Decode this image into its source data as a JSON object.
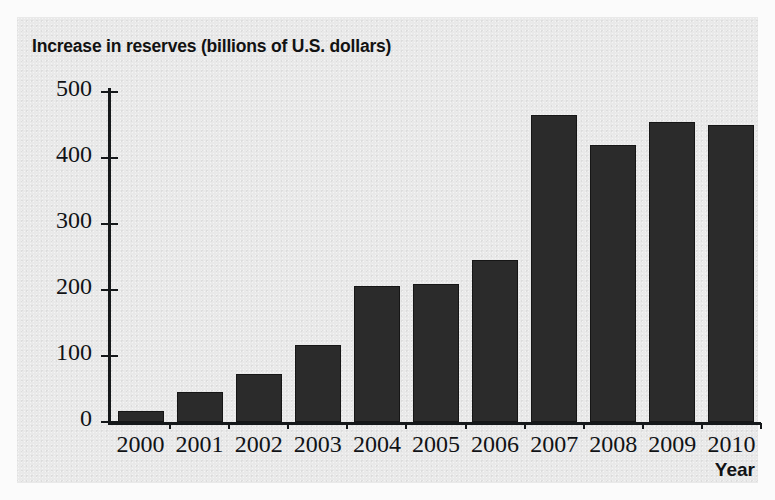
{
  "chart_data": {
    "type": "bar",
    "title": "Increase in reserves (billions of U.S. dollars)",
    "xlabel": "Year",
    "ylabel": "",
    "categories": [
      "2000",
      "2001",
      "2002",
      "2003",
      "2004",
      "2005",
      "2006",
      "2007",
      "2008",
      "2009",
      "2010"
    ],
    "values": [
      17,
      45,
      73,
      117,
      206,
      209,
      246,
      465,
      420,
      455,
      450
    ],
    "ylim": [
      0,
      500
    ],
    "yticks": [
      0,
      100,
      200,
      300,
      400,
      500
    ],
    "ytick_labels": [
      "0",
      "100",
      "200",
      "300",
      "400",
      "500"
    ],
    "grid": false,
    "legend": null,
    "bar_color": "#2b2b2b",
    "axis_color": "#15181a",
    "background_color": "#e9e9e9"
  },
  "page": {
    "title": "Increase in reserves (billions of U.S. dollars)",
    "x_axis_title": "Year"
  }
}
